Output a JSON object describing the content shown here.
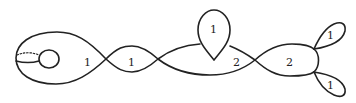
{
  "diagram": {
    "stroke_color": "#222222",
    "labels": [
      {
        "id": "left-blob",
        "text": "1",
        "x": 84,
        "y": 56
      },
      {
        "id": "lens-1",
        "text": "1",
        "x": 128,
        "y": 56
      },
      {
        "id": "teardrop",
        "text": "1",
        "x": 209,
        "y": 25
      },
      {
        "id": "lens-2",
        "text": "2",
        "x": 230,
        "y": 58
      },
      {
        "id": "right-lobe",
        "text": "2",
        "x": 288,
        "y": 58
      },
      {
        "id": "petal-top",
        "text": "1",
        "x": 325,
        "y": 30
      },
      {
        "id": "petal-bottom",
        "text": "1",
        "x": 325,
        "y": 82
      }
    ]
  }
}
